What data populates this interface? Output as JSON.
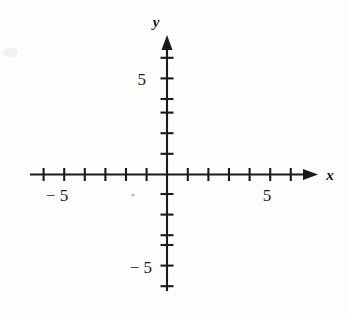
{
  "figure": {
    "kind": "blank-cartesian-coordinate-plane",
    "title": "",
    "background_color": "#fdfdfc",
    "ink_color": "#1a1a1a"
  },
  "axes": {
    "x_axis": {
      "label": "x",
      "label_position": "right-end",
      "arrow": "right",
      "origin_px": {
        "x": 167,
        "y": 174
      },
      "line_start_px": {
        "x": 30,
        "y": 174
      },
      "line_end_px": {
        "x": 305,
        "y": 174
      },
      "arrow_tip_px": {
        "x": 317,
        "y": 174
      },
      "tick_spacing_px": 20.6,
      "tick_half_length_px": 6,
      "tick_values": [
        -6,
        -5,
        -4,
        -3,
        -2,
        -1,
        1,
        2,
        3,
        4,
        5,
        6
      ],
      "labeled_ticks": [
        {
          "value": -5,
          "text": "− 5"
        },
        {
          "value": 5,
          "text": "5"
        }
      ]
    },
    "y_axis": {
      "label": "y",
      "label_position": "top-end",
      "arrow": "up",
      "line_start_px": {
        "x": 167,
        "y": 290
      },
      "line_end_px": {
        "x": 167,
        "y": 46
      },
      "arrow_tip_px": {
        "x": 167,
        "y": 36
      },
      "tick_spacing_px": 20.6,
      "tick_half_length_px": 6,
      "tick_values": [
        -6,
        -5,
        -4,
        -3,
        -2,
        -1,
        1,
        2,
        3,
        4,
        5,
        6
      ],
      "labeled_ticks": [
        {
          "value": 5,
          "text": "5"
        },
        {
          "value": -5,
          "text": "− 5"
        }
      ]
    }
  },
  "labels": {
    "x_axis_name": "x",
    "y_axis_name": "y",
    "x_positive_five": "5",
    "x_negative_five": "− 5",
    "y_positive_five": "5",
    "y_negative_five": "− 5"
  },
  "data_points": [],
  "curves": []
}
